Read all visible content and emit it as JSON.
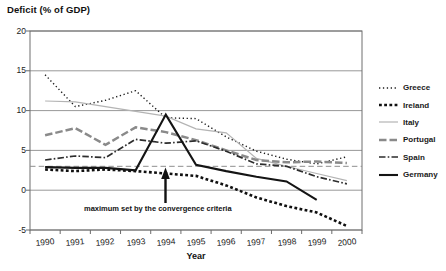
{
  "chart_data": {
    "type": "line",
    "title": "Deficit (% of GDP)",
    "xlabel": "Year",
    "ylabel": "Deficit (% of GDP)",
    "x": [
      1990,
      1991,
      1992,
      1993,
      1994,
      1995,
      1996,
      1997,
      1998,
      1999,
      2000
    ],
    "ylim": [
      -5,
      20
    ],
    "yticks": [
      20,
      15,
      10,
      5,
      0,
      -5
    ],
    "grid": true,
    "legend_position": "right",
    "series": [
      {
        "name": "Greece",
        "key": "greece",
        "values": [
          14.5,
          10.5,
          11.3,
          12.5,
          9.1,
          9.0,
          6.7,
          4.9,
          3.9,
          3.3,
          4.2
        ]
      },
      {
        "name": "Ireland",
        "key": "ireland",
        "values": [
          2.6,
          2.4,
          2.6,
          2.4,
          2.1,
          1.8,
          0.6,
          -0.9,
          -2.0,
          -2.8,
          -4.5
        ]
      },
      {
        "name": "Italy",
        "key": "italy",
        "values": [
          11.2,
          11.1,
          10.5,
          9.9,
          9.3,
          7.7,
          7.2,
          4.0,
          3.0,
          2.1,
          1.2
        ]
      },
      {
        "name": "Portugal",
        "key": "portugal",
        "values": [
          6.9,
          7.8,
          5.7,
          7.9,
          7.3,
          6.3,
          5.0,
          3.8,
          3.5,
          3.6,
          3.4
        ]
      },
      {
        "name": "Spain",
        "key": "spain",
        "values": [
          3.8,
          4.3,
          4.1,
          6.4,
          5.9,
          6.2,
          4.9,
          3.3,
          3.0,
          1.7,
          0.8
        ]
      },
      {
        "name": "Germany",
        "key": "germany",
        "values": [
          2.9,
          2.8,
          2.8,
          2.5,
          9.5,
          3.2,
          2.4,
          1.7,
          1.1,
          -1.2,
          null
        ]
      }
    ],
    "reference_line": {
      "value": 3,
      "label": "maximum set by the convergence criteria"
    }
  },
  "colors": {
    "greece": "#1c1c1c",
    "ireland": "#101010",
    "italy": "#b4b4b4",
    "portugal": "#8a8a8a",
    "spain": "#2d2d2d",
    "germany": "#141414",
    "reference": "#8f8f8f",
    "grid": "#7d7d7d",
    "text": "#1a1a1a",
    "background": "#ffffff"
  }
}
